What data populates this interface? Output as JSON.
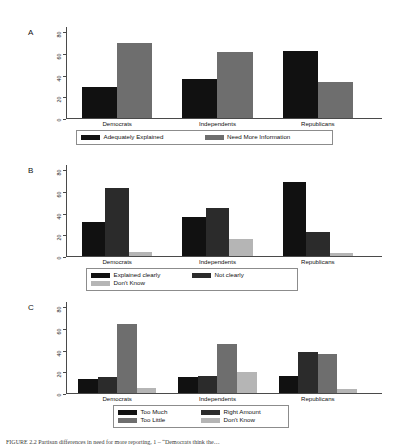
{
  "figure": {
    "caption": "FIGURE 2.2  Partisan differences in need for more reporting, 1 – “Democrats think the…",
    "panel_labels": [
      "A",
      "B",
      "C"
    ]
  },
  "axis": {
    "ticks": [
      "0",
      "20",
      "40",
      "60",
      "80"
    ],
    "tick_values": [
      0,
      20,
      40,
      60,
      80
    ],
    "ymin": 0,
    "ymax": 85
  },
  "colors": {
    "black": "#111111",
    "dark_gray": "#2b2b2b",
    "mid_gray": "#6e6e6e",
    "light_gray": "#b5b5b5",
    "axis": "#4a4a4a",
    "legend_border": "#8c8c8c",
    "background": "#ffffff"
  },
  "chart_data": [
    {
      "type": "bar",
      "panel": "A",
      "title": "",
      "xlabel": "",
      "ylabel": "",
      "ylim": [
        0,
        85
      ],
      "grid": false,
      "legend_position": "bottom",
      "categories": [
        "Democrats",
        "Independents",
        "Republicans"
      ],
      "series": [
        {
          "name": "Adequately Explained",
          "color": "#111111",
          "values": [
            29,
            36,
            62
          ]
        },
        {
          "name": "Need More Information",
          "color": "#6e6e6e",
          "values": [
            69,
            61,
            33
          ]
        }
      ]
    },
    {
      "type": "bar",
      "panel": "B",
      "title": "",
      "xlabel": "",
      "ylabel": "",
      "ylim": [
        0,
        85
      ],
      "grid": false,
      "legend_position": "bottom",
      "categories": [
        "Democrats",
        "Independents",
        "Republicans"
      ],
      "series": [
        {
          "name": "Explained clearly",
          "color": "#111111",
          "values": [
            31,
            36,
            68
          ]
        },
        {
          "name": "Not clearly",
          "color": "#2b2b2b",
          "values": [
            63,
            44,
            22
          ]
        },
        {
          "name": "Don't Know",
          "color": "#b5b5b5",
          "values": [
            4,
            16,
            3
          ]
        }
      ]
    },
    {
      "type": "bar",
      "panel": "C",
      "title": "",
      "xlabel": "",
      "ylabel": "",
      "ylim": [
        0,
        85
      ],
      "grid": false,
      "legend_position": "bottom",
      "categories": [
        "Democrats",
        "Independents",
        "Republicans"
      ],
      "series": [
        {
          "name": "Too Much",
          "color": "#111111",
          "values": [
            13,
            15,
            16
          ]
        },
        {
          "name": "Right Amount",
          "color": "#2b2b2b",
          "values": [
            15,
            16,
            38
          ]
        },
        {
          "name": "Too Little",
          "color": "#6e6e6e",
          "values": [
            64,
            45,
            36
          ]
        },
        {
          "name": "Don't Know",
          "color": "#b5b5b5",
          "values": [
            5,
            19,
            4
          ]
        }
      ]
    }
  ]
}
